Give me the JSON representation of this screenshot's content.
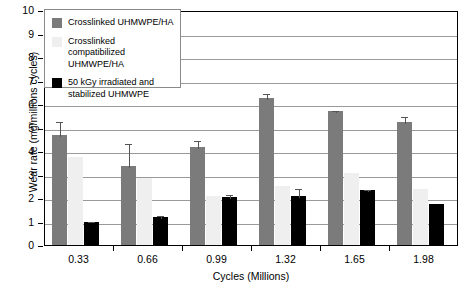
{
  "chart_data": {
    "type": "bar",
    "title": "",
    "xlabel": "Cycles (Millions)",
    "ylabel": "Wear rate (mg/millions cycles)",
    "categories": [
      "0.33",
      "0.66",
      "0.99",
      "1.32",
      "1.65",
      "1.98"
    ],
    "ylim": [
      0,
      10
    ],
    "yticks": [
      "0",
      "1",
      "2",
      "3",
      "4",
      "5",
      "6",
      "7",
      "8",
      "9",
      "10"
    ],
    "grid": true,
    "legend_position": "top-left",
    "series": [
      {
        "name": "Crosslinked UHMWPE/HA",
        "color": "#7b7b7b",
        "values": [
          4.7,
          3.35,
          4.15,
          6.25,
          5.7,
          5.25
        ],
        "errors": [
          0.6,
          1.05,
          0.35,
          0.25,
          0.1,
          0.3
        ]
      },
      {
        "name": "Crosslinked compatibilized UHMWPE/HA",
        "color": "#efefef",
        "values": [
          3.75,
          2.85,
          2.1,
          2.5,
          3.05,
          2.4
        ],
        "errors": [
          0,
          0,
          0,
          0,
          0,
          0
        ]
      },
      {
        "name": "50 kGy irradiated and stabilized UHMWPE",
        "color": "#000000",
        "values": [
          1.0,
          1.2,
          2.05,
          2.1,
          2.35,
          1.75
        ],
        "errors": [
          0.05,
          0.1,
          0.15,
          0.35,
          0.07,
          0
        ]
      }
    ]
  },
  "legend": {
    "items": [
      {
        "label": "Crosslinked UHMWPE/HA",
        "swatch": "dark-gray"
      },
      {
        "label": "Crosslinked compatibilized UHMWPE/HA",
        "swatch": "light-gray"
      },
      {
        "label": "50 kGy irradiated and stabilized UHMWPE",
        "swatch": "black"
      }
    ]
  }
}
